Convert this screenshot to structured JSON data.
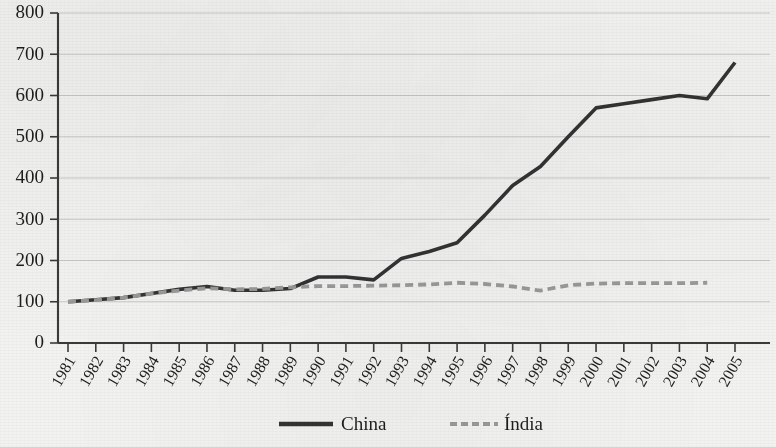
{
  "chart_data": {
    "type": "line",
    "title": "",
    "subtitle": "",
    "xlabel": "",
    "ylabel": "",
    "ylim": [
      0,
      800
    ],
    "ytick_step": 100,
    "yticks": [
      "0",
      "100",
      "200",
      "300",
      "400",
      "500",
      "600",
      "700",
      "800"
    ],
    "grid": true,
    "legend_position": "bottom-center",
    "x": [
      "1981",
      "1982",
      "1983",
      "1984",
      "1985",
      "1986",
      "1987",
      "1988",
      "1989",
      "1990",
      "1991",
      "1992",
      "1993",
      "1994",
      "1995",
      "1996",
      "1997",
      "1998",
      "1999",
      "2000",
      "2001",
      "2002",
      "2003",
      "2004",
      "2005"
    ],
    "series": [
      {
        "name": "China",
        "color": "#333333",
        "style": "solid",
        "values": [
          100,
          105,
          110,
          120,
          130,
          137,
          128,
          128,
          132,
          160,
          160,
          153,
          205,
          222,
          243,
          310,
          382,
          428,
          500,
          570,
          580,
          590,
          600,
          592,
          680
        ]
      },
      {
        "name": "Índia",
        "color": "#9a9a9a",
        "style": "dashed",
        "values": [
          100,
          104,
          110,
          120,
          127,
          133,
          130,
          131,
          135,
          138,
          138,
          139,
          140,
          142,
          146,
          143,
          137,
          127,
          140,
          144,
          145,
          145,
          145,
          146,
          null
        ]
      }
    ]
  },
  "legend": {
    "items": [
      {
        "label": "China",
        "color": "#333333",
        "style": "solid"
      },
      {
        "label": "Índia",
        "color": "#9a9a9a",
        "style": "dashed"
      }
    ]
  }
}
